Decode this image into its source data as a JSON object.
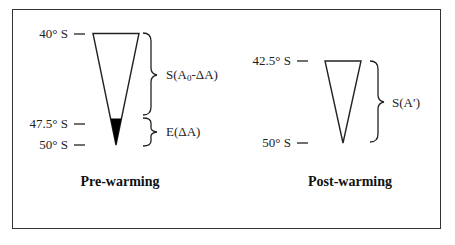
{
  "diagram": {
    "panels": [
      {
        "id": "pre-warming",
        "title": "Pre-warming",
        "latitudes": [
          {
            "label": "40° S",
            "y_px": 33
          },
          {
            "label": "47.5° S",
            "y_px": 123
          },
          {
            "label": "50° S",
            "y_px": 144
          }
        ],
        "braces": [
          {
            "label_main": "S(A",
            "label_sub": "0",
            "label_tail": "-ΔA)",
            "from": "40° S",
            "to": "47.5° S"
          },
          {
            "label": "E(ΔA)",
            "from": "47.5° S",
            "to": "50° S"
          }
        ],
        "triangle": {
          "top_width_px": 46,
          "filled_tip": true,
          "fill_color": "#000000"
        }
      },
      {
        "id": "post-warming",
        "title": "Post-warming",
        "latitudes": [
          {
            "label": "42.5° S",
            "y_px": 61
          },
          {
            "label": "50° S",
            "y_px": 142
          }
        ],
        "braces": [
          {
            "label": "S(A′)",
            "from": "42.5° S",
            "to": "50° S"
          }
        ],
        "triangle": {
          "top_width_px": 36,
          "filled_tip": false
        }
      }
    ],
    "colors": {
      "stroke": "#222222",
      "frame": "#333333",
      "fill": "#000000",
      "background": "#ffffff"
    }
  }
}
